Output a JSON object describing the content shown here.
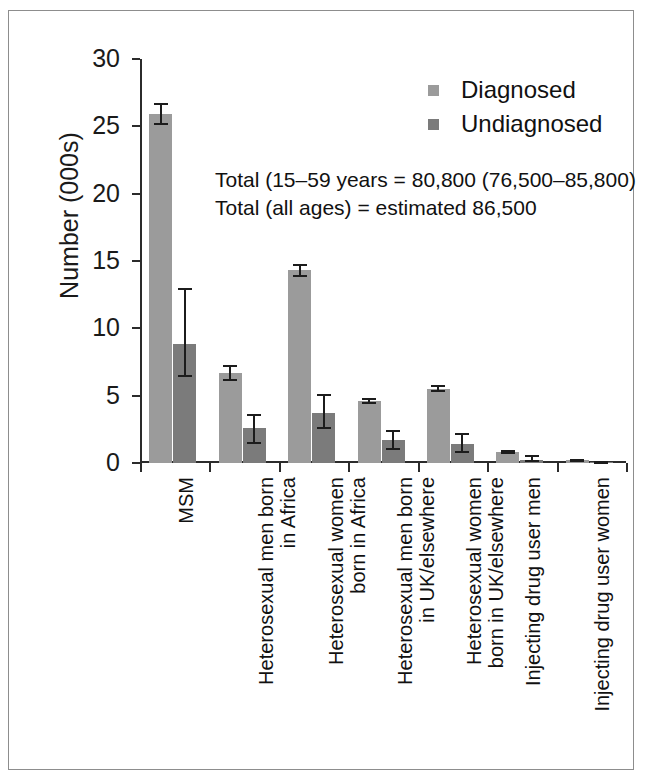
{
  "chart_data": {
    "type": "bar",
    "title": "",
    "xlabel": "",
    "ylabel": "Number (000s)",
    "ylim": [
      0,
      30
    ],
    "ytick_values": [
      0,
      5,
      10,
      15,
      20,
      25,
      30
    ],
    "ytick_labels": [
      "0",
      "5",
      "10",
      "15",
      "20",
      "25",
      "30"
    ],
    "grid": false,
    "legend_position": "top-right",
    "categories": [
      "MSM",
      "Heterosexual men born in Africa",
      "Heterosexual women born in Africa",
      "Heterosexual men born in UK/elsewhere",
      "Heterosexual women born in UK/elsewhere",
      "Injecting drug user men",
      "Injecting drug user women"
    ],
    "category_label_lines": [
      [
        "MSM",
        ""
      ],
      [
        "Heterosexual men born",
        "in Africa"
      ],
      [
        "Heterosexual women",
        "born in Africa"
      ],
      [
        "Heterosexual men born",
        "in UK/elsewhere"
      ],
      [
        "Heterosexual women",
        "born in UK/elsewhere"
      ],
      [
        "Injecting drug user men",
        ""
      ],
      [
        "Injecting drug user women",
        ""
      ]
    ],
    "series": [
      {
        "name": "Diagnosed",
        "color": "#9b9b9b",
        "values": [
          25.9,
          6.7,
          14.3,
          4.6,
          5.5,
          0.85,
          0.2
        ],
        "err_low": [
          25.1,
          6.1,
          13.8,
          4.35,
          5.25,
          0.7,
          0.1
        ],
        "err_high": [
          26.7,
          7.3,
          14.8,
          4.85,
          5.8,
          1.0,
          0.32
        ]
      },
      {
        "name": "Undiagnosed",
        "color": "#7b7b7b",
        "values": [
          8.8,
          2.6,
          3.7,
          1.7,
          1.4,
          0.25,
          0.04
        ],
        "err_low": [
          6.4,
          1.4,
          2.5,
          0.95,
          0.75,
          0.05,
          0.0
        ],
        "err_high": [
          13.0,
          3.65,
          5.1,
          2.45,
          2.2,
          0.6,
          0.1
        ]
      }
    ],
    "annotations": [
      "Total (15–59 years = 80,800 (76,500–85,800)",
      "Total (all ages) = estimated 86,500"
    ]
  },
  "legend": {
    "items": [
      {
        "label": "Diagnosed",
        "color": "#9b9b9b"
      },
      {
        "label": "Undiagnosed",
        "color": "#7b7b7b"
      }
    ]
  }
}
